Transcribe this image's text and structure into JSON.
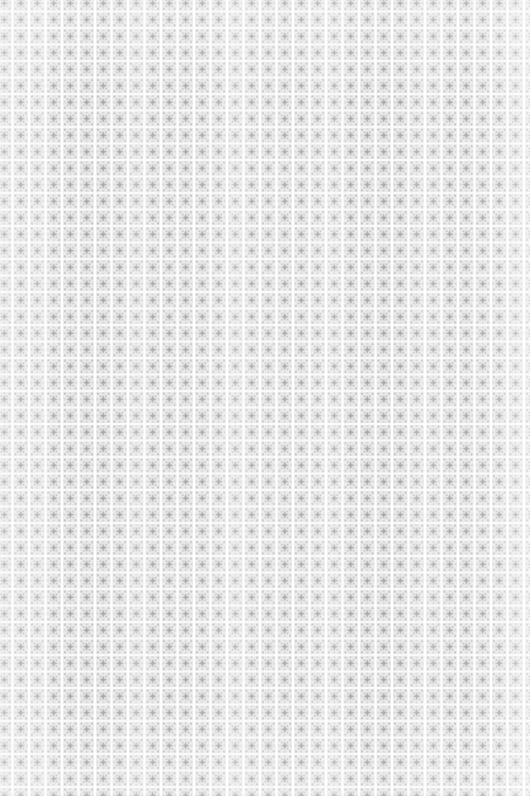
{
  "image": {
    "kind": "decorative-pattern-swatch",
    "subject": "Seamless ornamental damask-style tiled pattern",
    "description": "A flat, edge-to-edge repeating grid of square ornamental tiles. Each tile holds a four-pointed star or fleur motif at its centre, ringed by a stippled square frame. Tiles are divided by white gutters; the vertical gutters read brighter and wider than the horizontal ones, creating a faint columnar striping. The pattern is clipped mid-motif on all four edges, so it is a crop from a larger continuous surface.",
    "medium": "Monochrome grayscale, appears scanned or compressed",
    "has_text": "No",
    "has_ui_chrome": "No",
    "width_px": "530",
    "height_px": "796"
  },
  "pattern": {
    "motif_name": "four-pointed-star-in-stippled-frame",
    "tile_pitch_x_px": "16.5",
    "tile_pitch_y_px": "16.5",
    "columns_visible": "32",
    "rows_visible": "48",
    "gutter_style": "white, vertical gutters brighter and wider than horizontal",
    "edge_behaviour": "bleeds off all four edges, clipped mid-motif",
    "symmetry": "four-fold rotational, mirrored on both axes",
    "texture_note": "soft vertical luminance banding and fine stipple noise from the source scan"
  },
  "palette": {
    "gutter_white": "#ffffff",
    "tile_fill_light": "#eeeeee",
    "tile_fill_mid": "#e2e2e2",
    "stipple_grey": "#c2c2c2",
    "motif_grey": "#a6a6a6",
    "motif_accent_dark": "#969696",
    "overall_tone": "high-key neutral grey, no chromatic content"
  }
}
